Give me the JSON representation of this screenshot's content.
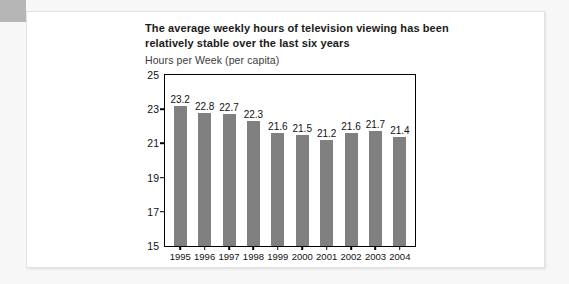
{
  "card": {
    "title": "The average weekly hours of television viewing has been relatively stable over the last six years",
    "subtitle": "Hours per Week (per capita)"
  },
  "chart_data": {
    "type": "bar",
    "title": "The average weekly hours of television viewing has been relatively stable over the last six years",
    "subtitle": "Hours per Week (per capita)",
    "xlabel": "",
    "ylabel": "Hours per Week (per capita)",
    "categories": [
      "1995",
      "1996",
      "1997",
      "1998",
      "1999",
      "2000",
      "2001",
      "2002",
      "2003",
      "2004"
    ],
    "values": [
      23.2,
      22.8,
      22.7,
      22.3,
      21.6,
      21.5,
      21.2,
      21.6,
      21.7,
      21.4
    ],
    "ylim": [
      15,
      25
    ],
    "yticks": [
      15,
      17,
      19,
      21,
      23,
      25
    ],
    "grid": false,
    "legend": false,
    "bar_color": "#808080",
    "axis_color": "#000000"
  }
}
